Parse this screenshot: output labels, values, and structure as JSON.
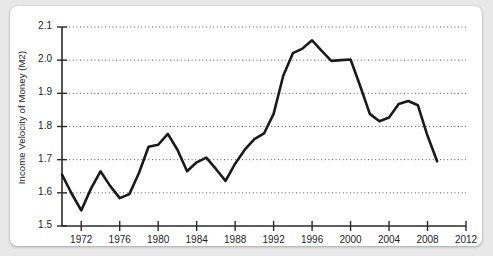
{
  "chart_data": {
    "type": "line",
    "title": "",
    "xlabel": "",
    "ylabel": "Income Velocity of Money (M2)",
    "xlim": [
      1970,
      2012
    ],
    "ylim": [
      1.5,
      2.1
    ],
    "grid": true,
    "legend": "none",
    "x_ticks": [
      1972,
      1976,
      1980,
      1984,
      1988,
      1992,
      1996,
      2000,
      2004,
      2008,
      2012
    ],
    "y_ticks": [
      1.5,
      1.6,
      1.7,
      1.8,
      1.9,
      2.0,
      2.1
    ],
    "line_color": "#1a1a1a",
    "series": [
      {
        "name": "Income Velocity of Money (M2)",
        "x": [
          1970,
          1971,
          1972,
          1973,
          1974,
          1975,
          1976,
          1977,
          1978,
          1979,
          1980,
          1981,
          1982,
          1983,
          1984,
          1985,
          1986,
          1987,
          1988,
          1989,
          1990,
          1991,
          1992,
          1993,
          1994,
          1995,
          1996,
          1997,
          1998,
          1999,
          2000,
          2001,
          2002,
          2003,
          2004,
          2005,
          2006,
          2007,
          2008,
          2009
        ],
        "values": [
          1.655,
          1.598,
          1.547,
          1.612,
          1.665,
          1.621,
          1.584,
          1.596,
          1.66,
          1.739,
          1.745,
          1.778,
          1.73,
          1.665,
          1.692,
          1.706,
          1.672,
          1.636,
          1.688,
          1.73,
          1.762,
          1.779,
          1.838,
          1.953,
          2.021,
          2.035,
          2.06,
          2.028,
          1.998,
          2.0,
          2.002,
          1.922,
          1.838,
          1.816,
          1.827,
          1.868,
          1.877,
          1.864,
          1.772,
          1.695
        ]
      }
    ]
  }
}
